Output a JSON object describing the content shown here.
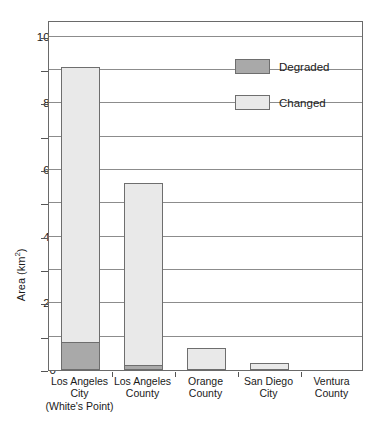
{
  "chart_data": {
    "type": "bar",
    "title": "",
    "subtitle": "",
    "xlabel": "",
    "ylabel": "Area (km",
    "ylabel_sup": "2",
    "ylabel_suffix": ")",
    "stacked": true,
    "grid": true,
    "legend_position": "top-right",
    "ylim": [
      0,
      105
    ],
    "ytick_labels": [
      "0",
      "20",
      "40",
      "60",
      "80",
      "100"
    ],
    "ytick_values": [
      0,
      20,
      40,
      60,
      80,
      100
    ],
    "yminor_values": [
      10,
      30,
      50,
      70,
      90
    ],
    "gridline_values": [
      10,
      20,
      30,
      40,
      50,
      60,
      70,
      80,
      90,
      100
    ],
    "categories": [
      {
        "line1": "Los Angeles",
        "line2": "City",
        "line3": "(White's Point)"
      },
      {
        "line1": "Los Angeles",
        "line2": "County",
        "line3": ""
      },
      {
        "line1": "Orange",
        "line2": "County",
        "line3": ""
      },
      {
        "line1": "San Diego",
        "line2": "City",
        "line3": ""
      },
      {
        "line1": "Ventura",
        "line2": "County",
        "line3": ""
      }
    ],
    "series": [
      {
        "name": "Degraded",
        "color": "#a9a9a9",
        "values": [
          8.5,
          1.5,
          0,
          0,
          0
        ]
      },
      {
        "name": "Changed",
        "color": "#e9e9e9",
        "values": [
          82.5,
          54.5,
          6.5,
          2.0,
          0
        ]
      }
    ],
    "totals": [
      91,
      56,
      6.5,
      2.0,
      0
    ]
  },
  "legend": {
    "items": [
      {
        "label": "Degraded",
        "swatch": "degraded"
      },
      {
        "label": "Changed",
        "swatch": "changed"
      }
    ]
  }
}
